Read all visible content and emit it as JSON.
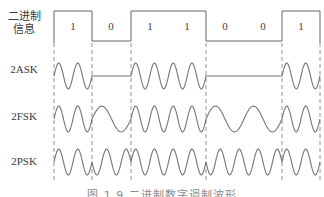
{
  "figure": {
    "caption": "图 1.9   二进制数字调制波形",
    "bits": [
      "1",
      "0",
      "1",
      "1",
      "0",
      "0",
      "1"
    ],
    "row_labels": {
      "binary": "二进制\n信息",
      "binary_line1": "二进制",
      "binary_line2": "信息",
      "ask": "2ASK",
      "fsk": "2FSK",
      "psk": "2PSK"
    },
    "colors": {
      "waveform": "#777777",
      "binary_signal": "#666666",
      "dashed": "#777777"
    }
  }
}
